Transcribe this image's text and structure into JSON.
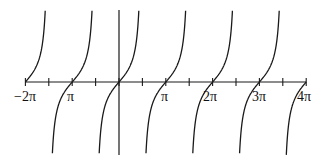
{
  "chart_data": {
    "type": "line",
    "title": "",
    "function": "y = tan(x)",
    "xlabel": "",
    "ylabel": "",
    "xlim": [
      "-2π",
      "4π"
    ],
    "xlim_numeric": [
      -6.2832,
      12.5664
    ],
    "ylim_numeric": [
      -4,
      4
    ],
    "grid": false,
    "legend": null,
    "x_tick_labels": [
      {
        "value": -6.2832,
        "label": "−2π"
      },
      {
        "value": -3.1416,
        "label": "π"
      },
      {
        "value": 3.1416,
        "label": "π"
      },
      {
        "value": 6.2832,
        "label": "2π"
      },
      {
        "value": 9.4248,
        "label": "3π"
      },
      {
        "value": 12.5664,
        "label": "4π"
      }
    ],
    "minor_ticks_at": [
      "-3π/2",
      "-π/2",
      "π/2",
      "3π/2",
      "5π/2",
      "7π/2"
    ],
    "vertical_asymptotes": [
      "-3π/2",
      "-π/2",
      "π/2",
      "3π/2",
      "5π/2",
      "7π/2"
    ],
    "zeros": [
      "-2π",
      "-π",
      "0",
      "π",
      "2π",
      "3π",
      "4π"
    ],
    "branches": [
      {
        "from": "-2π",
        "to": "-3π/2"
      },
      {
        "from": "-3π/2",
        "to": "-π/2"
      },
      {
        "from": "-π/2",
        "to": "π/2"
      },
      {
        "from": "π/2",
        "to": "3π/2"
      },
      {
        "from": "3π/2",
        "to": "5π/2"
      },
      {
        "from": "5π/2",
        "to": "7π/2"
      },
      {
        "from": "7π/2",
        "to": "4π"
      }
    ],
    "y_axis_at_x": 0,
    "stroke_color": "#1a1a1a"
  },
  "layout": {
    "origin_px": [
      119,
      82
    ],
    "px_per_pi": 46.8,
    "px_per_unit_y": 17.5,
    "y_top_px": 10,
    "y_bottom_px": 155,
    "x_left_px": 25,
    "x_right_px": 306
  },
  "labels": {
    "neg_two_pi": "−2π",
    "neg_pi": "π",
    "pi": "π",
    "two_pi": "2π",
    "three_pi": "3π",
    "four_pi": "4π"
  }
}
